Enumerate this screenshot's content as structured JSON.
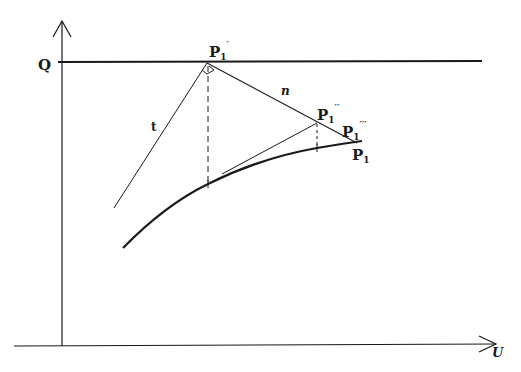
{
  "diagram": {
    "axes": {
      "y_label": "Q",
      "x_label": "U"
    },
    "lines": {
      "t_label": "t",
      "n_label": "n"
    },
    "points": {
      "p1_prime": {
        "base": "P",
        "sub": "1",
        "sup": "′"
      },
      "p1_double_prime": {
        "base": "P",
        "sub": "1",
        "sup": "′′"
      },
      "p1_triple_prime": {
        "base": "P",
        "sub": "1",
        "sup": "′′′"
      },
      "p1": {
        "base": "P",
        "sub": "1",
        "sup": ""
      }
    },
    "colors": {
      "ink": "#1a1a1a",
      "background": "#ffffff"
    }
  }
}
